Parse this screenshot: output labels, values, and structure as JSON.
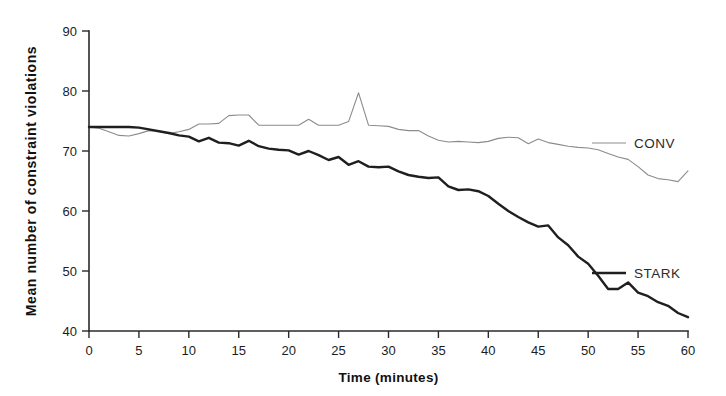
{
  "chart_data": {
    "type": "line",
    "title": "",
    "xlabel": "Time (minutes)",
    "ylabel": "Mean number of constraint violations",
    "xlim": [
      0,
      60
    ],
    "ylim": [
      40,
      90
    ],
    "xticks": [
      0,
      5,
      10,
      15,
      20,
      25,
      30,
      35,
      40,
      45,
      50,
      55,
      60
    ],
    "yticks": [
      40,
      50,
      60,
      70,
      80,
      90
    ],
    "grid": false,
    "legend_position": "inside-right",
    "x": [
      0,
      1,
      2,
      3,
      4,
      5,
      6,
      7,
      8,
      9,
      10,
      11,
      12,
      13,
      14,
      15,
      16,
      17,
      18,
      19,
      20,
      21,
      22,
      23,
      24,
      25,
      26,
      27,
      28,
      29,
      30,
      31,
      32,
      33,
      34,
      35,
      36,
      37,
      38,
      39,
      40,
      41,
      42,
      43,
      44,
      45,
      46,
      47,
      48,
      49,
      50,
      51,
      52,
      53,
      54,
      55,
      56,
      57,
      58,
      59,
      60
    ],
    "series": [
      {
        "name": "CONV",
        "color": "#8c8c8c",
        "width": 1.1,
        "values": [
          74.0,
          73.8,
          73.2,
          72.6,
          72.5,
          72.9,
          73.4,
          73.3,
          72.9,
          73.2,
          73.6,
          74.5,
          74.5,
          74.6,
          75.9,
          76.0,
          76.0,
          74.3,
          74.3,
          74.3,
          74.3,
          74.3,
          75.3,
          74.3,
          74.3,
          74.3,
          74.9,
          79.7,
          74.3,
          74.2,
          74.1,
          73.6,
          73.4,
          73.4,
          72.5,
          71.8,
          71.5,
          71.6,
          71.5,
          71.4,
          71.6,
          72.1,
          72.3,
          72.2,
          71.2,
          72.0,
          71.4,
          71.1,
          70.8,
          70.6,
          70.5,
          70.2,
          69.6,
          69.0,
          68.6,
          67.4,
          66.0,
          65.4,
          65.2,
          64.9,
          66.7
        ]
      },
      {
        "name": "STARK",
        "color": "#1f1f1f",
        "width": 2.4,
        "values": [
          74.0,
          74.0,
          74.0,
          74.0,
          74.0,
          73.9,
          73.6,
          73.3,
          73.0,
          72.6,
          72.4,
          71.6,
          72.2,
          71.4,
          71.3,
          70.9,
          71.7,
          70.8,
          70.4,
          70.2,
          70.1,
          69.4,
          70.0,
          69.3,
          68.5,
          69.0,
          67.7,
          68.3,
          67.4,
          67.3,
          67.4,
          66.6,
          66.0,
          65.7,
          65.5,
          65.6,
          64.1,
          63.5,
          63.6,
          63.3,
          62.5,
          61.2,
          60.0,
          59.0,
          58.1,
          57.4,
          57.6,
          55.6,
          54.3,
          52.4,
          51.2,
          49.2,
          47.0,
          47.0,
          48.1,
          46.4,
          45.8,
          44.8,
          44.2,
          43.0,
          42.3
        ]
      }
    ],
    "legend": [
      {
        "label": "CONV",
        "color": "#8c8c8c"
      },
      {
        "label": "STARK",
        "color": "#1f1f1f"
      }
    ]
  }
}
